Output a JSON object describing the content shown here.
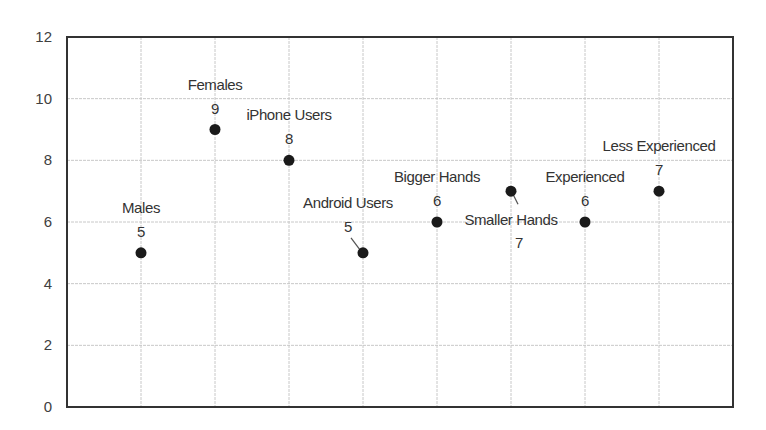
{
  "chart_data": {
    "type": "scatter",
    "title": "",
    "xlabel": "",
    "ylabel": "",
    "xlim": [
      0,
      9
    ],
    "ylim": [
      0,
      12
    ],
    "yticks": [
      0,
      2,
      4,
      6,
      8,
      10,
      12
    ],
    "xticks_labels_visible": false,
    "grid": true,
    "legend": null,
    "points": [
      {
        "x": 1,
        "y": 5,
        "name": "Males",
        "value_label": "5",
        "label_pos": "above"
      },
      {
        "x": 2,
        "y": 9,
        "name": "Females",
        "value_label": "9",
        "label_pos": "above"
      },
      {
        "x": 3,
        "y": 8,
        "name": "iPhone Users",
        "value_label": "8",
        "label_pos": "above"
      },
      {
        "x": 4,
        "y": 5,
        "name": "Android Users",
        "value_label": "5",
        "label_pos": "above-left-leader"
      },
      {
        "x": 5,
        "y": 6,
        "name": "Bigger Hands",
        "value_label": "6",
        "label_pos": "above"
      },
      {
        "x": 6,
        "y": 7,
        "name": "Smaller Hands",
        "value_label": "7",
        "label_pos": "below-leader"
      },
      {
        "x": 7,
        "y": 6,
        "name": "Experienced",
        "value_label": "6",
        "label_pos": "above"
      },
      {
        "x": 8,
        "y": 7,
        "name": "Less Experienced",
        "value_label": "7",
        "label_pos": "above"
      }
    ]
  },
  "colors": {
    "marker": "#1a1a1a",
    "grid": "#c8c8c8",
    "frame": "#333333",
    "text": "#333333"
  }
}
